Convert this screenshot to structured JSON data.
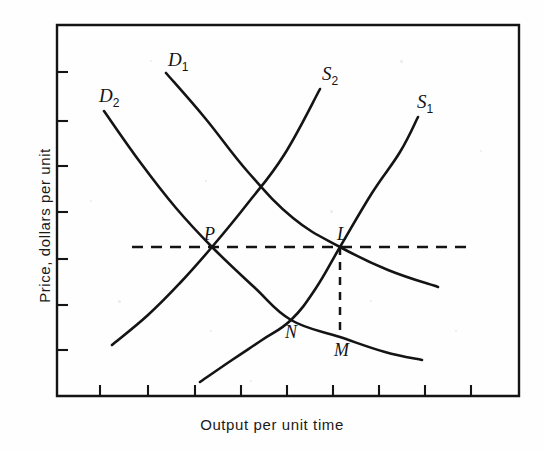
{
  "figure": {
    "type": "line-diagram",
    "background_color": "#fefefe",
    "ink_color": "#141414"
  },
  "axes": {
    "x_title": "Output per unit time",
    "y_title": "Price, dollars per unit",
    "frame": {
      "left": 57,
      "right": 519,
      "top": 25,
      "bottom": 396
    },
    "tick_direction": "inward",
    "tick_length": 11,
    "x_ticks": [
      100,
      148,
      195,
      241,
      287,
      333,
      379,
      425,
      471
    ],
    "y_ticks": [
      72,
      121,
      166,
      212,
      259,
      305,
      350
    ],
    "x_tick_labels": [],
    "y_tick_labels": []
  },
  "chart_data": {
    "type": "line",
    "title": "",
    "subtitle": "",
    "xlabel": "Output per unit time",
    "ylabel": "Price, dollars per unit",
    "xlim": [
      57,
      519
    ],
    "ylim": [
      396,
      25
    ],
    "grid": false,
    "legend": "inline-curve-labels",
    "axis_tick_labels_shown": false,
    "series": [
      {
        "name": "D1",
        "label": "D₁",
        "role": "demand-curve",
        "style": "solid",
        "slope": "downward",
        "points": [
          [
            166,
            73
          ],
          [
            205,
            118
          ],
          [
            248,
            172
          ],
          [
            293,
            218
          ],
          [
            340,
            247
          ],
          [
            388,
            270
          ],
          [
            438,
            287
          ]
        ]
      },
      {
        "name": "D2",
        "label": "D₂",
        "role": "demand-curve-shifted",
        "style": "solid",
        "slope": "downward",
        "points": [
          [
            104,
            111
          ],
          [
            140,
            162
          ],
          [
            176,
            208
          ],
          [
            212,
            247
          ],
          [
            254,
            287
          ],
          [
            291,
            320
          ],
          [
            340,
            337
          ],
          [
            385,
            352
          ],
          [
            422,
            360
          ]
        ]
      },
      {
        "name": "S1",
        "label": "S₁",
        "role": "supply-curve",
        "style": "solid",
        "slope": "upward",
        "points": [
          [
            200,
            382
          ],
          [
            232,
            360
          ],
          [
            262,
            340
          ],
          [
            291,
            320
          ],
          [
            316,
            288
          ],
          [
            340,
            247
          ],
          [
            372,
            193
          ],
          [
            400,
            152
          ],
          [
            418,
            117
          ]
        ]
      },
      {
        "name": "S2",
        "label": "S₂",
        "role": "supply-curve-shifted",
        "style": "solid",
        "slope": "upward",
        "points": [
          [
            112,
            345
          ],
          [
            148,
            315
          ],
          [
            180,
            283
          ],
          [
            212,
            247
          ],
          [
            248,
            203
          ],
          [
            284,
            155
          ],
          [
            320,
            89
          ]
        ]
      }
    ],
    "curve_labels": [
      {
        "text": "D",
        "sub": "1",
        "x": 168,
        "y": 50
      },
      {
        "text": "D",
        "sub": "2",
        "x": 99,
        "y": 86
      },
      {
        "text": "S",
        "sub": "2",
        "x": 322,
        "y": 64
      },
      {
        "text": "S",
        "sub": "1",
        "x": 417,
        "y": 92
      }
    ],
    "annotations": [
      {
        "label": "P",
        "x": 212,
        "y": 247,
        "label_x": 204,
        "label_y": 225,
        "meaning": "intersection of D2 and S2"
      },
      {
        "label": "L",
        "x": 340,
        "y": 247,
        "label_x": 337,
        "label_y": 225,
        "meaning": "intersection of D1 and S1"
      },
      {
        "label": "N",
        "x": 291,
        "y": 320,
        "label_x": 285,
        "label_y": 323,
        "meaning": "intersection of D2 and S1"
      },
      {
        "label": "M",
        "x": 340,
        "y": 337,
        "label_x": 334,
        "label_y": 341,
        "meaning": "foot of vertical from L on D2"
      }
    ],
    "guide_lines": [
      {
        "name": "price-level-line",
        "orientation": "horizontal",
        "style": "dashed",
        "from": [
          132,
          247
        ],
        "to": [
          470,
          247
        ]
      },
      {
        "name": "quantity-drop-line",
        "orientation": "vertical",
        "style": "dashed",
        "from": [
          340,
          247
        ],
        "to": [
          340,
          336
        ]
      }
    ]
  }
}
